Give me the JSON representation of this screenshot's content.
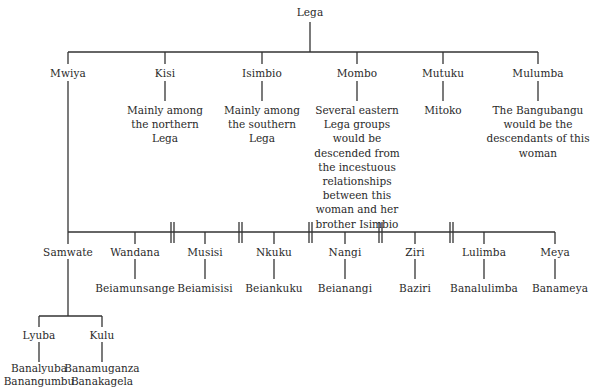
{
  "root": {
    "label": "Lega"
  },
  "children": [
    {
      "label": "Mwiya",
      "note": ""
    },
    {
      "label": "Kisi",
      "note": "Mainly among the northern Lega",
      "note_lines": [
        "Mainly among",
        "the northern",
        "Lega"
      ]
    },
    {
      "label": "Isimbio",
      "note": "Mainly among the southern Lega",
      "note_lines": [
        "Mainly among",
        "the southern",
        "Lega"
      ]
    },
    {
      "label": "Mombo",
      "note": "Several eastern Lega groups would be descended from the incestuous relationships between this woman and her brother Isimbio",
      "note_lines": [
        "Several eastern",
        "Lega groups",
        "would be",
        "descended from",
        "the incestuous",
        "relationships",
        "between this",
        "woman and her",
        "brother Isimbio"
      ]
    },
    {
      "label": "Mutuku",
      "note": "Mitoko",
      "note_lines": [
        "Mitoko"
      ]
    },
    {
      "label": "Mulumba",
      "note": "The Bangubangu would be the descendants of this woman",
      "note_lines": [
        "The Bangubangu",
        "would be the",
        "descendants of this",
        "woman"
      ]
    }
  ],
  "mwiya_children": [
    {
      "label": "Samwate",
      "descendants": ""
    },
    {
      "label": "Wandana",
      "descendants": "Beiamunsange"
    },
    {
      "label": "Musisi",
      "descendants": "Beiamisisi"
    },
    {
      "label": "Nkuku",
      "descendants": "Beiankuku"
    },
    {
      "label": "Nangi",
      "descendants": "Beianangi"
    },
    {
      "label": "Ziri",
      "descendants": "Baziri"
    },
    {
      "label": "Lulimba",
      "descendants": "Banalulimba"
    },
    {
      "label": "Meya",
      "descendants": "Banameya"
    }
  ],
  "samwate_children": [
    {
      "label": "Lyuba",
      "descendants_lines": [
        "Banalyuba",
        "Banangumbu"
      ]
    },
    {
      "label": "Kulu",
      "descendants_lines": [
        "Banamuganza",
        "Banakagela"
      ]
    }
  ],
  "separator_symbol": "||"
}
